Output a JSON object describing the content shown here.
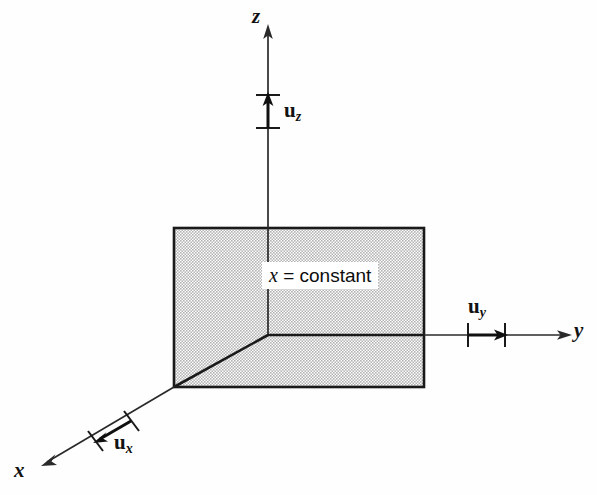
{
  "figure": {
    "background_color": "#fefefe",
    "line_color": "#1a1a1a",
    "plane_fill_color": "#c9c9c9",
    "plane_label": {
      "variable": "x",
      "relation": "= constant"
    },
    "axes": [
      {
        "name": "x",
        "label": "x",
        "direction": "down-left",
        "unit_vector": {
          "symbol": "u",
          "subscript": "x"
        }
      },
      {
        "name": "y",
        "label": "y",
        "direction": "right",
        "unit_vector": {
          "symbol": "u",
          "subscript": "y"
        }
      },
      {
        "name": "z",
        "label": "z",
        "direction": "up",
        "unit_vector": {
          "symbol": "u",
          "subscript": "z"
        }
      }
    ]
  }
}
